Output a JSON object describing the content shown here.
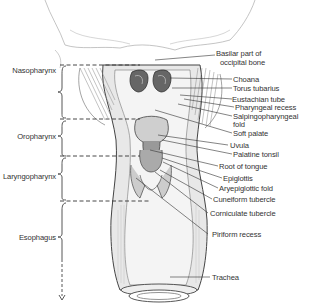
{
  "figure": {
    "regions": [
      {
        "label": "Nasopharynx",
        "y": 71
      },
      {
        "label": "Oropharynx",
        "y": 136
      },
      {
        "label": "Laryngopharynx",
        "y": 176
      },
      {
        "label": "Esophagus",
        "y": 238
      }
    ],
    "structures": [
      {
        "label": "Basilar part of",
        "y": 53
      },
      {
        "label": "occipital bone",
        "y": 62
      },
      {
        "label": "Choana",
        "y": 77
      },
      {
        "label": "Torus tubarius",
        "y": 86
      },
      {
        "label": "Eustachian tube",
        "y": 97
      },
      {
        "label": "Pharyngeal recess",
        "y": 105
      },
      {
        "label": "Salpingopharyngeal",
        "y": 114
      },
      {
        "label": "fold",
        "y": 122
      },
      {
        "label": "Soft palate",
        "y": 131
      },
      {
        "label": "Uvula",
        "y": 143
      },
      {
        "label": "Palatine tonsil",
        "y": 152
      },
      {
        "label": "Root of tongue",
        "y": 164
      },
      {
        "label": "Epiglottis",
        "y": 176
      },
      {
        "label": "Aryepiglottic fold",
        "y": 186
      },
      {
        "label": "Cuneiform tubercle",
        "y": 197
      },
      {
        "label": "Corniculate tubercle",
        "y": 211
      },
      {
        "label": "Piriform recess",
        "y": 232
      },
      {
        "label": "Trachea",
        "y": 275
      }
    ]
  }
}
